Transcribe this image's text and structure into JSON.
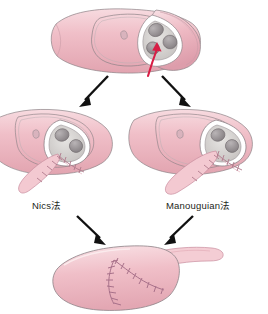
{
  "figure": {
    "title": "",
    "colors": {
      "tissue_pink": "#f0bfc8",
      "tissue_pink_light": "#f7dbe0",
      "tissue_pink_dark": "#e0a2ae",
      "patch_pink": "#f3c9d1",
      "outline_gray": "#8d8287",
      "valve_gray": "#a8a2a4",
      "valve_gray_dark": "#7f797c",
      "lumen_gray": "#d6d4d2",
      "arrow_black": "#111111",
      "arrow_red": "#d81e45",
      "suture_mauve": "#b07a8c",
      "label_text": "#231f20"
    },
    "panels": [
      {
        "name": "aortic-root-before",
        "caption": "",
        "annotation_arrow": "red-arrow-incision-site",
        "valve_cusps": 3
      },
      {
        "name": "nics-technique",
        "caption": "Nics法"
      },
      {
        "name": "manouguian-technique",
        "caption": "Manouguian法"
      },
      {
        "name": "aortic-root-after",
        "caption": "",
        "suture_lines": 2
      }
    ],
    "flow_arrows": [
      {
        "name": "arrow-top-to-left",
        "direction": "down-left"
      },
      {
        "name": "arrow-top-to-right",
        "direction": "down-right"
      },
      {
        "name": "arrow-left-to-bottom",
        "direction": "down-right"
      },
      {
        "name": "arrow-right-to-bottom",
        "direction": "down-left"
      }
    ]
  }
}
